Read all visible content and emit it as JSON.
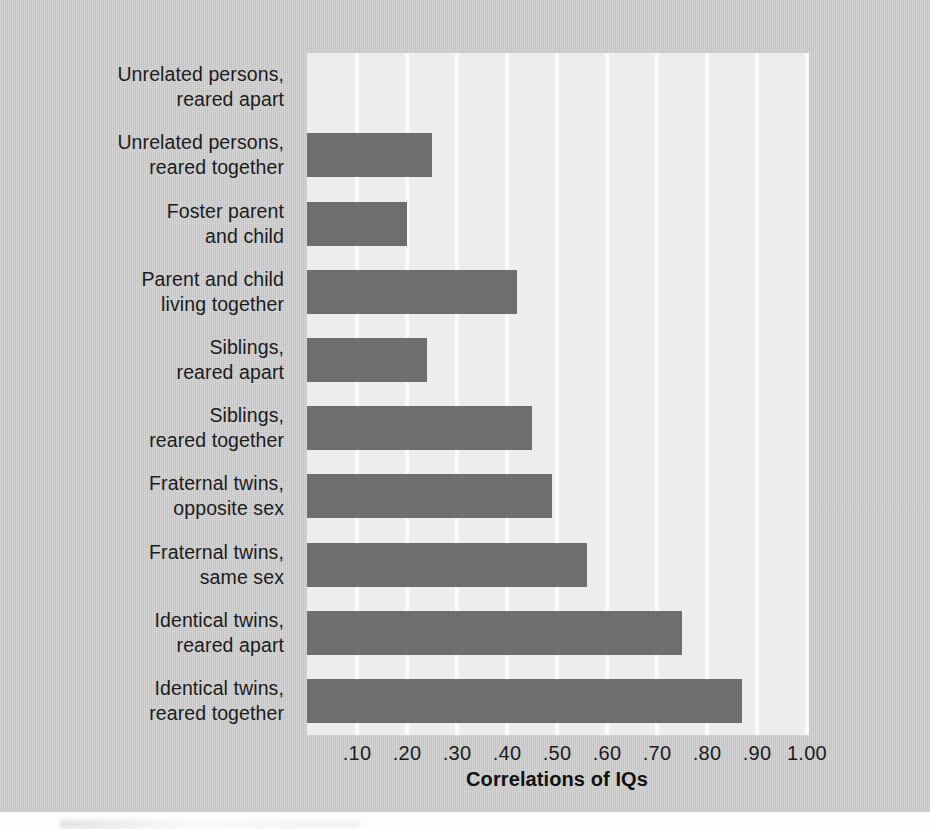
{
  "chart_data": {
    "type": "bar",
    "orientation": "horizontal",
    "title": "",
    "xlabel": "Correlations of IQs",
    "ylabel": "",
    "xlim": [
      0,
      1.0
    ],
    "grid": true,
    "legend": "none",
    "xtick_labels": [
      ".10",
      ".20",
      ".30",
      ".40",
      ".50",
      ".60",
      ".70",
      ".80",
      ".90",
      "1.00"
    ],
    "xtick_values": [
      0.1,
      0.2,
      0.3,
      0.4,
      0.5,
      0.6,
      0.7,
      0.8,
      0.9,
      1.0
    ],
    "categories": [
      "Unrelated persons,\nreared apart",
      "Unrelated persons,\nreared together",
      "Foster parent\nand child",
      "Parent and child\nliving together",
      "Siblings,\nreared apart",
      "Siblings,\nreared together",
      "Fraternal twins,\nopposite sex",
      "Fraternal twins,\nsame sex",
      "Identical twins,\nreared apart",
      "Identical twins,\nreared together"
    ],
    "values": [
      0.0,
      0.25,
      0.2,
      0.42,
      0.24,
      0.45,
      0.49,
      0.56,
      0.75,
      0.87
    ],
    "bar_color": "#6d6d6d",
    "plot_background": "#ededed",
    "gridline_color": "#fbfbfb",
    "figure_background": "#c9c9c9"
  }
}
